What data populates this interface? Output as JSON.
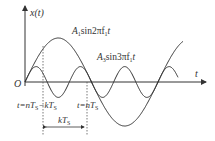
{
  "figure": {
    "y_axis_label": "x(t)",
    "x_axis_label": "t",
    "origin_label": "O",
    "curves": [
      {
        "name": "fundamental",
        "label_main": "A",
        "label_sub": "1",
        "label_rest": "sin2πf",
        "label_sub2": "1",
        "label_t": "t",
        "amplitude": 1.0,
        "freq_multiple": 1
      },
      {
        "name": "third-harmonic",
        "label_main": "A",
        "label_sub": "3",
        "label_rest": "sin3πf",
        "label_sub2": "1",
        "label_t": "t",
        "amplitude": 0.35,
        "freq_multiple": 3
      }
    ],
    "markers": {
      "left": {
        "text": "t=nT",
        "sub": "S",
        "text2": "−kT",
        "sub2": "S"
      },
      "right": {
        "text": "t=nT",
        "sub": "S"
      },
      "interval": {
        "text": "kT",
        "sub": "S"
      }
    },
    "colors": {
      "line": "#333333"
    }
  }
}
